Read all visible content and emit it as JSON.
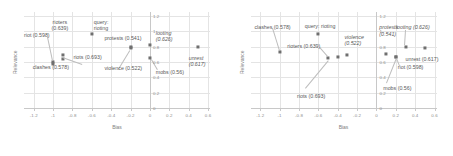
{
  "figure": {
    "panels": [
      {
        "name": "left-panel",
        "chart_data": {
          "type": "scatter",
          "title": "",
          "xlabel": "Bias",
          "ylabel": "Relevance",
          "xlim": [
            -1.3,
            0.62
          ],
          "ylim": [
            0,
            1.25
          ],
          "xticks": [
            "-1.2",
            "-1",
            "-0.8",
            "-0.6",
            "-0.4",
            "-0.2",
            "0",
            "0.2",
            "0.4",
            "0.6"
          ],
          "xtickvals": [
            -1.2,
            -1.0,
            -0.8,
            -0.6,
            -0.4,
            -0.2,
            0,
            0.2,
            0.4,
            0.6
          ],
          "yticks": [
            "0",
            "0.2",
            "0.4",
            "0.6",
            "0.8",
            "1",
            "1.2"
          ],
          "ytickvals": [
            0,
            0.2,
            0.4,
            0.6,
            0.8,
            1.0,
            1.2
          ],
          "grid": true,
          "legend": "none",
          "points": [
            {
              "label": "riot (0.598)",
              "x": -1.0,
              "y": 0.598,
              "italic": false
            },
            {
              "label": "clashes (0.578)",
              "x": -1.0,
              "y": 0.578,
              "italic": false
            },
            {
              "label": "rioters (0.639)",
              "x": -0.9,
              "y": 0.639,
              "italic": false
            },
            {
              "label": "riots (0.693)",
              "x": -0.9,
              "y": 0.693,
              "italic": false
            },
            {
              "label": "query: rioting",
              "x": -0.6,
              "y": 0.97,
              "italic": false
            },
            {
              "label": "protests (0.541)",
              "x": -0.2,
              "y": 0.8,
              "italic": false
            },
            {
              "label": "violence (0.522)",
              "x": -0.2,
              "y": 0.78,
              "italic": false
            },
            {
              "label": "looting (0.626)",
              "x": 0.0,
              "y": 0.82,
              "italic": true
            },
            {
              "label": "mobs (0.56)",
              "x": 0.0,
              "y": 0.65,
              "italic": false
            },
            {
              "label": "unrest (0.617)",
              "x": 0.5,
              "y": 0.8,
              "italic": true
            }
          ],
          "annotations": [
            {
              "text": "rioters\n(0.639)",
              "italic": false,
              "align": "center"
            },
            {
              "text": "query:\nrioting",
              "italic": false,
              "align": "left"
            },
            {
              "text": "riot (0.598)",
              "italic": false,
              "align": "left"
            },
            {
              "text": "protests (0.541)",
              "italic": false,
              "align": "left"
            },
            {
              "text": "looting\n(0.626)",
              "italic": true,
              "align": "left"
            },
            {
              "text": "riots (0.693)",
              "italic": false,
              "align": "left"
            },
            {
              "text": "clashes (0.578)",
              "italic": false,
              "align": "left"
            },
            {
              "text": "violence (0.522)",
              "italic": false,
              "align": "left"
            },
            {
              "text": "mobs (0.56)",
              "italic": false,
              "align": "left"
            },
            {
              "text": "unrest\n(0.617)",
              "italic": true,
              "align": "left"
            }
          ]
        }
      },
      {
        "name": "right-panel",
        "chart_data": {
          "type": "scatter",
          "title": "",
          "xlabel": "Bias",
          "ylabel": "Relevance",
          "xlim": [
            -1.3,
            0.62
          ],
          "ylim": [
            0,
            1.25
          ],
          "xticks": [
            "-1.2",
            "-1",
            "-0.8",
            "-0.6",
            "-0.4",
            "-0.2",
            "0",
            "0.2",
            "0.4",
            "0.6"
          ],
          "xtickvals": [
            -1.2,
            -1.0,
            -0.8,
            -0.6,
            -0.4,
            -0.2,
            0,
            0.2,
            0.4,
            0.6
          ],
          "yticks": [
            "0",
            "0.2",
            "0.4",
            "0.6",
            "0.8",
            "1",
            "1.2"
          ],
          "ytickvals": [
            0,
            0.2,
            0.4,
            0.6,
            0.8,
            1.0,
            1.2
          ],
          "grid": true,
          "legend": "none",
          "points": [
            {
              "label": "clashes (0.578)",
              "x": -1.0,
              "y": 0.73,
              "italic": false
            },
            {
              "label": "query: rioting",
              "x": -0.6,
              "y": 0.97,
              "italic": false
            },
            {
              "label": "riots (0.693)",
              "x": -0.5,
              "y": 0.655,
              "italic": false
            },
            {
              "label": "rioters (0.639)",
              "x": -0.4,
              "y": 0.66,
              "italic": false
            },
            {
              "label": "violence (0.522)",
              "x": -0.3,
              "y": 0.69,
              "italic": true
            },
            {
              "label": "protests (0.541)",
              "x": 0.1,
              "y": 0.7,
              "italic": true
            },
            {
              "label": "mobs (0.56)",
              "x": 0.2,
              "y": 0.665,
              "italic": false
            },
            {
              "label": "riot (0.598)",
              "x": 0.2,
              "y": 0.665,
              "italic": false
            },
            {
              "label": "looting (0.626)",
              "x": 0.3,
              "y": 0.8,
              "italic": true
            },
            {
              "label": "unrest (0.617)",
              "x": 0.5,
              "y": 0.78,
              "italic": false
            }
          ],
          "annotations": [
            {
              "text": "clashes (0.578)",
              "italic": false,
              "align": "left"
            },
            {
              "text": "query: rioting",
              "italic": false,
              "align": "left"
            },
            {
              "text": "rioters (0.639)",
              "italic": false,
              "align": "left"
            },
            {
              "text": "violence\n(0.522)",
              "italic": true,
              "align": "left"
            },
            {
              "text": "protests\n(0.541)",
              "italic": true,
              "align": "left"
            },
            {
              "text": "looting (0.626)",
              "italic": true,
              "align": "left"
            },
            {
              "text": "unrest (0.617)",
              "italic": false,
              "align": "left"
            },
            {
              "text": "riot (0.598)",
              "italic": false,
              "align": "left"
            },
            {
              "text": "mobs (0.56)",
              "italic": false,
              "align": "left"
            },
            {
              "text": "riots (0.693)",
              "italic": false,
              "align": "left"
            }
          ]
        }
      }
    ],
    "style": {
      "point_color": "#6f6f6f",
      "grid_color": "#e4e4e4",
      "axis_color": "#c8c8c8",
      "label_color": "#5a5a5a",
      "tick_color": "#8c8c8c"
    }
  }
}
